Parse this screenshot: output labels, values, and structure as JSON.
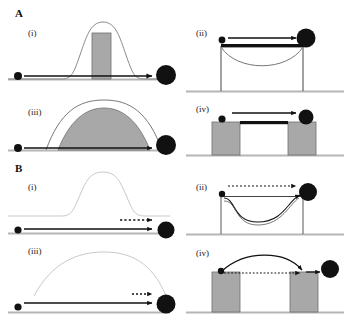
{
  "figure": {
    "background_color": "#ffffff",
    "ink_color": "#111111",
    "gray_fill": "#a8a8a8",
    "faint_gray": "#c9c9c9",
    "ground_color": "#b5b5b5",
    "width": 350,
    "height": 318
  },
  "panels": {
    "A": {
      "letter": "A",
      "sub": {
        "i": "(i)",
        "ii": "(ii)",
        "iii": "(iii)",
        "iv": "(iv)"
      }
    },
    "B": {
      "letter": "B",
      "sub": {
        "i": "(i)",
        "ii": "(ii)",
        "iii": "(iii)",
        "iv": "(iv)"
      }
    }
  },
  "elements": {
    "small_ball": "small-black-ball",
    "large_ball": "large-black-ball",
    "hill_curve": "energy-barrier-hill",
    "valley_curve": "energy-well-dip",
    "gray_bar": "narrow-gray-barrier",
    "gray_dome": "wide-gray-barrier",
    "platform": "raised-platform",
    "block_left": "gray-block-left",
    "block_right": "gray-block-right",
    "bridge_bar": "black-bridge-bar",
    "solid_arrow": "solid-path-arrow",
    "dotted_arrow": "dotted-path-arrow",
    "curved_arrow": "curved-path-arrow",
    "ground_line": "ground-baseline"
  }
}
